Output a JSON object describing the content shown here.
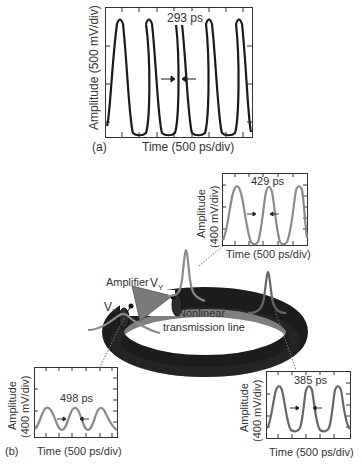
{
  "figure": {
    "panel_a": {
      "label": "(a)",
      "ylabel": "Amplitude (500 mV/div)",
      "xlabel": "Time (500 ps/div)",
      "annotation": "293 ps",
      "curve_color": "#1a1a1a"
    },
    "panel_b": {
      "label": "(b)",
      "amplifier_label": "Amplifier",
      "vx_label": "V",
      "vx_sub": "X",
      "vy_label": "V",
      "vy_sub": "Y",
      "line_label_1": "Nonlinear",
      "line_label_2": "transmission line",
      "inset_top_right": {
        "ylabel_1": "Amplitude",
        "ylabel_2": "(400 mV/div)",
        "xlabel": "Time (500 ps/div)",
        "annotation": "429 ps",
        "curve_color": "#8a8a8a"
      },
      "inset_bottom_left": {
        "ylabel_1": "Amplitude",
        "ylabel_2": "(400 mV/div)",
        "xlabel": "Time (500 ps/div)",
        "annotation": "498 ps",
        "curve_color": "#8a8a8a"
      },
      "inset_bottom_right": {
        "ylabel_1": "Amplitude",
        "ylabel_2": "(400 mV/div)",
        "xlabel": "Time (500 ps/div)",
        "annotation": "385 ps",
        "curve_color": "#666666"
      },
      "colors": {
        "ring": "#1c1c1c",
        "amplifier": "#7a7a7a",
        "pulse": "#8a8a8a"
      }
    }
  }
}
